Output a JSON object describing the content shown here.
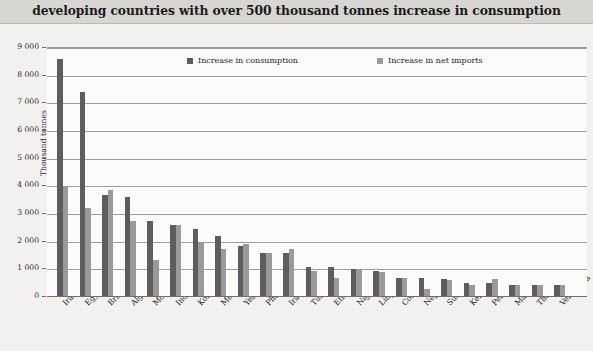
{
  "header": {
    "title": "developing countries with over 500 thousand tonnes increase in consumption"
  },
  "legend": {
    "items": [
      {
        "label": "Increase in consumption",
        "color": "#5d5d5d",
        "key": "consumption"
      },
      {
        "label": "Increase in net imports",
        "color": "#9a9a9a",
        "key": "imports"
      }
    ]
  },
  "axes": {
    "y_title": "Thousand tonnes",
    "y_ticks": [
      "0",
      "1 000",
      "2 000",
      "3 000",
      "4 000",
      "5 000",
      "6 000",
      "7 000",
      "8 000",
      "9 000"
    ]
  },
  "chart_data": {
    "type": "bar",
    "title": "developing countries with over 500 thousand tonnes increase in consumption",
    "xlabel": "",
    "ylabel": "Thousand tonnes",
    "ylim": [
      0,
      9000
    ],
    "ytick_step": 1000,
    "grid": true,
    "legend_position": "top-inside",
    "categories": [
      "Iran",
      "Egypt",
      "Brazil",
      "Algeria",
      "Morocco",
      "Indonesia",
      "Korea, Rep.",
      "Mexico",
      "Yemen",
      "Philippines",
      "Iraq",
      "Tunisia",
      "Ethiopia/Eritrea",
      "Nigeria",
      "Libya",
      "Colombia",
      "Nepal",
      "Sudan",
      "Kenya",
      "Peru",
      "Malaysia",
      "Thailand",
      "Venezuela"
    ],
    "series": [
      {
        "name": "Increase in consumption",
        "color": "#5d5d5d",
        "values": [
          8600,
          7400,
          3700,
          3600,
          2750,
          2600,
          2450,
          2200,
          1850,
          1600,
          1600,
          1100,
          1100,
          1000,
          950,
          700,
          700,
          650,
          500,
          500,
          450,
          450,
          450
        ]
      },
      {
        "name": "Increase in net imports",
        "color": "#9a9a9a",
        "values": [
          4000,
          3200,
          3850,
          2750,
          1350,
          2600,
          2000,
          1750,
          1900,
          1600,
          1750,
          950,
          700,
          1000,
          900,
          700,
          280,
          600,
          420,
          650,
          420,
          430,
          430
        ]
      }
    ]
  }
}
